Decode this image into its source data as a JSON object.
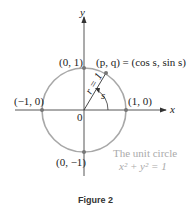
{
  "diagram": {
    "axes": {
      "x_label": "x",
      "y_label": "y",
      "origin_label": "0"
    },
    "points": [
      {
        "id": "top",
        "label": "(0, 1)"
      },
      {
        "id": "left",
        "label": "(−1, 0)"
      },
      {
        "id": "right",
        "label": "(1, 0)"
      },
      {
        "id": "bottom",
        "label": "(0, −1)"
      }
    ],
    "pq_point": {
      "label_prefix": "(p, q) = (cos s, sin s)"
    },
    "radius_label": "r = 1",
    "angle_label": "s",
    "circle_caption": {
      "line1": "The unit circle",
      "line2": "x² + y² = 1"
    },
    "colors": {
      "circle": "#a8a8a8",
      "axes": "#444444",
      "points": "#777777",
      "caption_gray": "#aaaaaa"
    }
  },
  "figure": {
    "caption": "Figure 2"
  }
}
